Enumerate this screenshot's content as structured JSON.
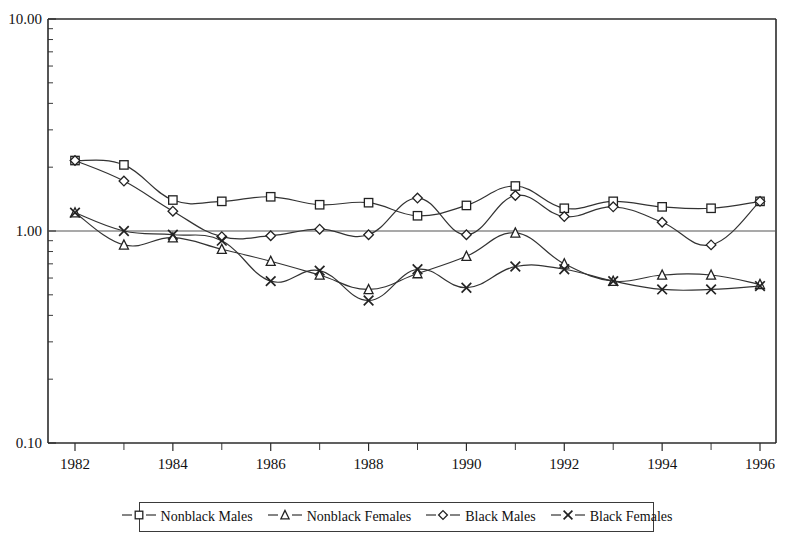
{
  "chart_data": {
    "type": "line",
    "title": "",
    "subtitle": "",
    "xlabel": "",
    "ylabel": "",
    "yscale": "log",
    "ylim": [
      0.1,
      10.0
    ],
    "xlim": [
      1982,
      1996
    ],
    "grid": false,
    "reference_line": 1.0,
    "legend_position": "bottom",
    "y_tick_labels": [
      "10.00",
      "1.00",
      "0.10"
    ],
    "y_tick_values": [
      10.0,
      1.0,
      0.1
    ],
    "x_tick_labels": [
      "1982",
      "1984",
      "1986",
      "1988",
      "1990",
      "1992",
      "1994",
      "1996"
    ],
    "x_tick_values": [
      1982,
      1984,
      1986,
      1988,
      1990,
      1992,
      1994,
      1996
    ],
    "x_minor_ticks": [
      1983,
      1985,
      1987,
      1989,
      1991,
      1993,
      1995
    ],
    "x": [
      1982,
      1983,
      1984,
      1985,
      1986,
      1987,
      1988,
      1989,
      1990,
      1991,
      1992,
      1993,
      1994,
      1995,
      1996
    ],
    "series": [
      {
        "name": "Nonblack Males",
        "marker": "square",
        "values": [
          2.15,
          2.05,
          1.4,
          1.38,
          1.45,
          1.33,
          1.36,
          1.18,
          1.32,
          1.63,
          1.28,
          1.38,
          1.3,
          1.28,
          1.38
        ]
      },
      {
        "name": "Nonblack Females",
        "marker": "triangle",
        "values": [
          1.22,
          0.86,
          0.93,
          0.82,
          0.72,
          0.62,
          0.53,
          0.63,
          0.76,
          0.98,
          0.7,
          0.58,
          0.62,
          0.62,
          0.56
        ]
      },
      {
        "name": "Black Males",
        "marker": "diamond",
        "values": [
          2.15,
          1.72,
          1.24,
          0.94,
          0.95,
          1.02,
          0.96,
          1.43,
          0.96,
          1.47,
          1.17,
          1.3,
          1.1,
          0.86,
          1.38
        ]
      },
      {
        "name": "Black Females",
        "marker": "cross",
        "values": [
          1.22,
          1.0,
          0.96,
          0.9,
          0.58,
          0.65,
          0.47,
          0.66,
          0.54,
          0.68,
          0.66,
          0.58,
          0.53,
          0.53,
          0.55
        ]
      }
    ]
  },
  "legend": {
    "items": [
      {
        "label": "Nonblack Males",
        "marker": "square"
      },
      {
        "label": "Nonblack Females",
        "marker": "triangle"
      },
      {
        "label": "Black Males",
        "marker": "diamond"
      },
      {
        "label": "Black Females",
        "marker": "cross"
      }
    ]
  }
}
